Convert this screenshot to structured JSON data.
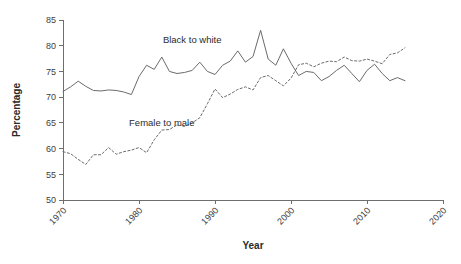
{
  "chart_data": {
    "type": "line",
    "title": "",
    "xlabel": "Year",
    "ylabel": "Percentage",
    "xlim": [
      1970,
      2020
    ],
    "ylim": [
      50,
      85
    ],
    "xticks": [
      1970,
      1980,
      1990,
      2000,
      2010,
      2020
    ],
    "xtick_labels": [
      "1970",
      "1980",
      "1990",
      "2000",
      "2010",
      "2020"
    ],
    "yticks": [
      50,
      55,
      60,
      65,
      70,
      75,
      80,
      85
    ],
    "ytick_labels": [
      "50",
      "55",
      "60",
      "65",
      "70",
      "75",
      "80",
      "85"
    ],
    "grid": false,
    "legend": "inline-annotations",
    "line_color": "#6b6b6b",
    "series": [
      {
        "name": "Black to white",
        "style": "solid",
        "label_x": 1987,
        "label_y": 80.6,
        "x": [
          1970,
          1971,
          1972,
          1973,
          1974,
          1975,
          1976,
          1977,
          1978,
          1979,
          1980,
          1981,
          1982,
          1983,
          1984,
          1985,
          1986,
          1987,
          1988,
          1989,
          1990,
          1991,
          1992,
          1993,
          1994,
          1995,
          1996,
          1997,
          1998,
          1999,
          2000,
          2001,
          2002,
          2003,
          2004,
          2005,
          2006,
          2007,
          2008,
          2009,
          2010,
          2011,
          2012,
          2013,
          2014,
          2015
        ],
        "values": [
          71.1,
          72.0,
          73.1,
          72.1,
          71.3,
          71.2,
          71.4,
          71.3,
          71.0,
          70.5,
          74.0,
          76.2,
          75.4,
          77.8,
          75.0,
          74.6,
          74.8,
          75.2,
          76.8,
          75.0,
          74.4,
          76.2,
          77.0,
          79.0,
          76.8,
          77.9,
          83.0,
          77.4,
          76.2,
          79.4,
          76.6,
          74.2,
          75.0,
          74.8,
          73.2,
          74.0,
          75.2,
          76.2,
          74.6,
          73.0,
          75.2,
          76.4,
          74.6,
          73.2,
          73.8,
          73.2
        ]
      },
      {
        "name": "Female to male",
        "style": "dashed",
        "label_x": 1983,
        "label_y": 64.3,
        "x": [
          1970,
          1971,
          1972,
          1973,
          1974,
          1975,
          1976,
          1977,
          1978,
          1979,
          1980,
          1981,
          1982,
          1983,
          1984,
          1985,
          1986,
          1987,
          1988,
          1989,
          1990,
          1991,
          1992,
          1993,
          1994,
          1995,
          1996,
          1997,
          1998,
          1999,
          2000,
          2001,
          2002,
          2003,
          2004,
          2005,
          2006,
          2007,
          2008,
          2009,
          2010,
          2011,
          2012,
          2013,
          2014,
          2015
        ],
        "values": [
          59.4,
          59.0,
          57.9,
          56.9,
          58.8,
          58.8,
          60.2,
          58.9,
          59.4,
          59.7,
          60.2,
          59.2,
          61.7,
          63.6,
          63.7,
          64.6,
          64.3,
          65.0,
          66.0,
          68.7,
          71.6,
          69.9,
          70.6,
          71.5,
          72.0,
          71.4,
          73.8,
          74.2,
          73.2,
          72.2,
          73.7,
          76.3,
          76.6,
          75.9,
          76.6,
          77.0,
          76.9,
          77.8,
          77.1,
          77.0,
          77.4,
          77.0,
          76.5,
          78.3,
          78.6,
          79.6
        ]
      }
    ]
  }
}
